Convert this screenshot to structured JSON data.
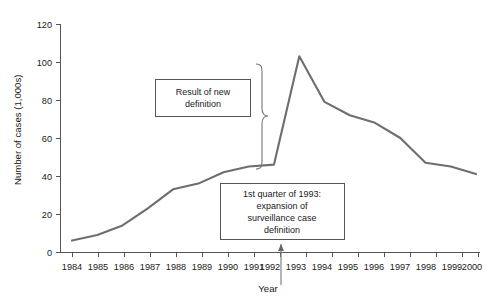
{
  "chart_data": {
    "type": "line",
    "title": "",
    "subtitle": "",
    "xlabel": "Year",
    "ylabel": "Number of cases (1,000s)",
    "categories": [
      "1984",
      "1985",
      "1986",
      "1987",
      "1988",
      "1989",
      "1990",
      "1991",
      "1992",
      "1993",
      "1994",
      "1995",
      "1996",
      "1997",
      "1998",
      "1999",
      "2000"
    ],
    "x": [
      1984,
      1985,
      1986,
      1987,
      1988,
      1989,
      1990,
      1991,
      1992,
      1993,
      1994,
      1995,
      1996,
      1997,
      1998,
      1999,
      2000
    ],
    "values": [
      6,
      9,
      14,
      23,
      33,
      36,
      42,
      45,
      46,
      103,
      79,
      72,
      68,
      60,
      47,
      45,
      41
    ],
    "series": [
      {
        "name": "Number of cases",
        "values": [
          6,
          9,
          14,
          23,
          33,
          36,
          42,
          45,
          46,
          103,
          79,
          72,
          68,
          60,
          47,
          45,
          41
        ]
      }
    ],
    "xlim": [
      1984,
      2000
    ],
    "ylim": [
      0,
      120
    ],
    "yticks": [
      0,
      20,
      40,
      60,
      80,
      100,
      120
    ],
    "ytick_labels": [
      "0",
      "20",
      "40",
      "60",
      "80",
      "100",
      "120"
    ],
    "xtick_labels": [
      "1984",
      "1985",
      "1986",
      "1987",
      "1988",
      "1989",
      "1990",
      "1991",
      "1992",
      "1993",
      "1994",
      "1995",
      "1996",
      "1997",
      "1998",
      "1999",
      "2000"
    ],
    "grid": false,
    "legend": false,
    "legend_position": "none",
    "line_color": "#6e6e6e",
    "axis_color": "#555555",
    "annotations": [
      {
        "id": "result-of-new-definition",
        "lines": [
          "Result of new",
          "definition"
        ],
        "text": "Result of new definition"
      },
      {
        "id": "first-quarter-1993",
        "lines": [
          "1st quarter of 1993:",
          "expansion of",
          "surveillance case",
          "definition"
        ],
        "text": "1st quarter of 1993: expansion of surveillance case definition"
      }
    ],
    "markers": [
      {
        "id": "definition-change-marker",
        "x_value": 1992.5,
        "label": ""
      }
    ]
  },
  "axes": {
    "y_title": "Number of cases (1,000s)",
    "x_title": "Year"
  }
}
